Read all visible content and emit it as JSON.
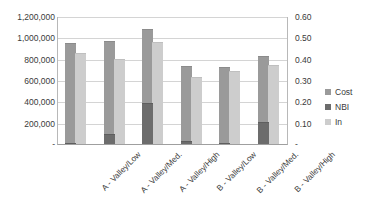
{
  "chart_data": {
    "type": "bar",
    "title": "",
    "subtitle": "",
    "xlabel": "",
    "ylabel": "",
    "grid": true,
    "legend_position": "right",
    "categories": [
      "A - Valley/Low",
      "A - Valley/Med.",
      "A - Valley/High",
      "B - Valley/Low",
      "B - Valley/Med.",
      "B - Valley/High"
    ],
    "series": [
      {
        "name": "Cost",
        "axis": "left",
        "color": "#9a9a9a",
        "values": [
          945000,
          962000,
          1077000,
          736000,
          722000,
          822000
        ]
      },
      {
        "name": "NBI",
        "axis": "right",
        "color": "#6c6c6c",
        "values": [
          0.005,
          0.045,
          0.19,
          0.015,
          0.007,
          0.105
        ]
      },
      {
        "name": "In",
        "axis": "left",
        "color": "#cdcdcd",
        "values": [
          850000,
          800000,
          953000,
          626000,
          681000,
          739000
        ]
      }
    ],
    "left_axis": {
      "min": 0,
      "max": 1200000,
      "tick_labels": [
        "1,200,000",
        "1,000,000",
        "800,000",
        "600,000",
        "400,000",
        "200,000",
        "-"
      ],
      "tick_values": [
        1200000,
        1000000,
        800000,
        600000,
        400000,
        200000,
        0
      ]
    },
    "right_axis": {
      "min": 0,
      "max": 0.6,
      "tick_labels": [
        "0.60",
        "0.50",
        "0.40",
        "0.30",
        "0.20",
        "0.10",
        "-"
      ],
      "tick_values": [
        0.6,
        0.5,
        0.4,
        0.3,
        0.2,
        0.1,
        0
      ]
    },
    "legend": [
      {
        "label": "Cost",
        "color": "#9a9a9a"
      },
      {
        "label": "NBI",
        "color": "#6c6c6c"
      },
      {
        "label": "In",
        "color": "#cdcdcd"
      }
    ]
  }
}
